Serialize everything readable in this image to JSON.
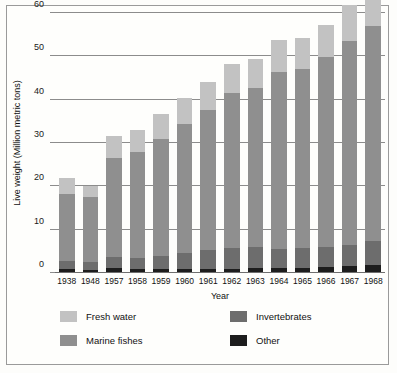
{
  "chart_data": {
    "type": "bar",
    "stacked": true,
    "title": "",
    "xlabel": "Year",
    "ylabel": "Live weight (Million metric tons)",
    "ylim": [
      0,
      60
    ],
    "yticks": [
      0,
      10,
      20,
      30,
      40,
      50,
      60
    ],
    "ytick_labels": [
      "0",
      "10",
      "20",
      "30",
      "40",
      "50",
      "60"
    ],
    "grid": true,
    "legend_position": "bottom",
    "categories": [
      "1938",
      "1948",
      "1957",
      "1958",
      "1959",
      "1960",
      "1961",
      "1962",
      "1963",
      "1964",
      "1965",
      "1966",
      "1967",
      "1968"
    ],
    "series": [
      {
        "name": "Other",
        "color": "#1d1d1d",
        "values": [
          0.9,
          0.8,
          1.1,
          1.0,
          1.0,
          1.0,
          1.0,
          1.0,
          1.1,
          1.1,
          1.2,
          1.4,
          1.6,
          1.9
        ]
      },
      {
        "name": "Invertebrates",
        "color": "#6d6d6d",
        "values": [
          1.9,
          1.7,
          2.7,
          2.5,
          2.9,
          3.6,
          4.3,
          4.7,
          4.9,
          4.5,
          4.5,
          4.7,
          4.9,
          5.4
        ]
      },
      {
        "name": "Marine fishes",
        "color": "#8f8f8f",
        "values": [
          15.5,
          15.1,
          22.8,
          24.5,
          27.1,
          29.7,
          32.3,
          35.8,
          36.6,
          40.9,
          41.3,
          43.8,
          47.1,
          49.8
        ]
      },
      {
        "name": "Fresh water",
        "color": "#c2c2c2",
        "values": [
          3.7,
          2.5,
          5.1,
          5.0,
          5.8,
          6.2,
          6.6,
          6.7,
          6.7,
          7.2,
          7.2,
          7.3,
          8.2,
          8.2
        ]
      }
    ],
    "totals": [
      22.0,
      20.1,
      31.7,
      33.0,
      36.8,
      40.5,
      44.2,
      48.2,
      49.3,
      53.7,
      54.2,
      57.2,
      61.8,
      65.3
    ]
  },
  "legend": {
    "entries": [
      {
        "label": "Fresh water",
        "color": "#c2c2c2"
      },
      {
        "label": "Marine fishes",
        "color": "#8f8f8f"
      },
      {
        "label": "Invertebrates",
        "color": "#6d6d6d"
      },
      {
        "label": "Other",
        "color": "#1d1d1d"
      }
    ]
  }
}
